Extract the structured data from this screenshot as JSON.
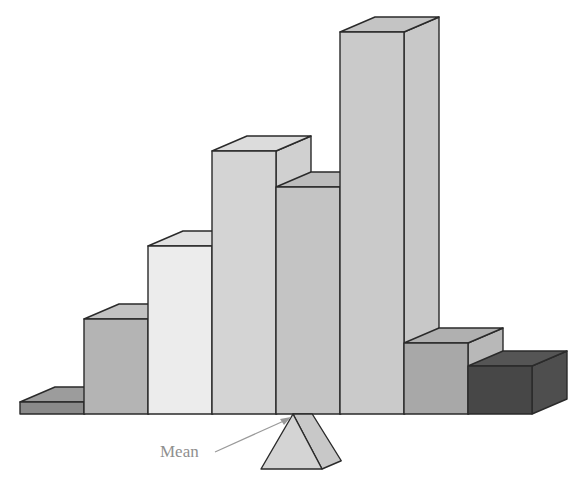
{
  "chart_data": {
    "type": "bar",
    "style": "3d-histogram-balanced-on-fulcrum",
    "title": "",
    "xlabel": "",
    "ylabel": "",
    "categories": [
      "1",
      "2",
      "3",
      "4",
      "5",
      "6",
      "7",
      "8"
    ],
    "values": [
      12,
      95,
      168,
      263,
      227,
      382,
      71,
      48
    ],
    "units": "relative height (px)",
    "grid": false,
    "legend": null,
    "annotations": [
      {
        "text": "Mean",
        "points_to": "balance point under the histogram (fulcrum apex)"
      }
    ]
  },
  "geometry": {
    "baseline_y": 414,
    "bar_width": 64,
    "first_bar_x": 20,
    "depth_dx": 35,
    "depth_dy": -15,
    "fulcrum": {
      "apex_x": 293,
      "apex_y": 414,
      "base_y": 469,
      "base_left_x": 261,
      "base_right_x": 322
    }
  },
  "bars": [
    {
      "label": "bar-1",
      "height": 12,
      "front": "#8a8a8a",
      "top": "#9c9c9c",
      "side": "#7c7c7c"
    },
    {
      "label": "bar-2",
      "height": 95,
      "front": "#b4b4b4",
      "top": "#c2c2c2",
      "side": "#a8a8a8"
    },
    {
      "label": "bar-3",
      "height": 168,
      "front": "#ececec",
      "top": "#e2e2e2",
      "side": "#d8d8d8"
    },
    {
      "label": "bar-4",
      "height": 263,
      "front": "#d4d4d4",
      "top": "#dcdcdc",
      "side": "#d0d0d0"
    },
    {
      "label": "bar-5",
      "height": 227,
      "front": "#c4c4c4",
      "top": "#bcbcbc",
      "side": "#b8b8b8"
    },
    {
      "label": "bar-6",
      "height": 382,
      "front": "#cacaca",
      "top": "#c4c4c4",
      "side": "#c8c8c8"
    },
    {
      "label": "bar-7",
      "height": 71,
      "front": "#a8a8a8",
      "top": "#b0b0b0",
      "side": "#b8b8b8"
    },
    {
      "label": "bar-8",
      "height": 48,
      "front": "#474747",
      "top": "#555555",
      "side": "#4e4e4e"
    }
  ],
  "annotation": {
    "mean_label": "Mean",
    "mean_label_color": "#8f8f8f",
    "arrow_color": "#9a9a9a"
  },
  "colors": {
    "outline": "#2a2a2a",
    "fulcrum_front": "#d4d4d4",
    "fulcrum_side": "#c8c8c8"
  }
}
